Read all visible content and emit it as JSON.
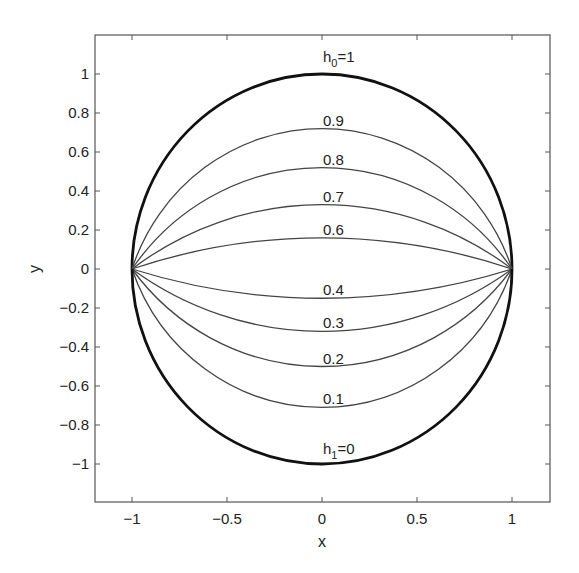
{
  "chart_data": {
    "type": "line",
    "title": "",
    "xlabel": "x",
    "ylabel": "y",
    "xlim": [
      -1.2,
      1.2
    ],
    "ylim": [
      -1.2,
      1.2
    ],
    "grid": false,
    "legend": "none (inline curve labels)",
    "xticks": [
      -1,
      -0.5,
      0,
      0.5,
      1
    ],
    "xtick_labels": [
      "−1",
      "−0.5",
      "0",
      "0.5",
      "1"
    ],
    "yticks": [
      -1,
      -0.8,
      -0.6,
      -0.4,
      -0.2,
      0,
      0.2,
      0.4,
      0.6,
      0.8,
      1
    ],
    "ytick_labels": [
      "−1",
      "−0.8",
      "−0.6",
      "−0.4",
      "−0.2",
      "0",
      "0.2",
      "0.4",
      "0.6",
      "0.8",
      "1"
    ],
    "series": [
      {
        "name": "h0=1",
        "label_main": "h",
        "label_sub": "0",
        "label_rest": "=1",
        "apex_y": 1.0,
        "bold": true
      },
      {
        "name": "0.9",
        "label_main": "0.9",
        "apex_y": 0.72,
        "bold": false
      },
      {
        "name": "0.8",
        "label_main": "0.8",
        "apex_y": 0.52,
        "bold": false
      },
      {
        "name": "0.7",
        "label_main": "0.7",
        "apex_y": 0.33,
        "bold": false
      },
      {
        "name": "0.6",
        "label_main": "0.6",
        "apex_y": 0.16,
        "bold": false
      },
      {
        "name": "0.4",
        "label_main": "0.4",
        "apex_y": -0.15,
        "bold": false
      },
      {
        "name": "0.3",
        "label_main": "0.3",
        "apex_y": -0.32,
        "bold": false
      },
      {
        "name": "0.2",
        "label_main": "0.2",
        "apex_y": -0.5,
        "bold": false
      },
      {
        "name": "0.1",
        "label_main": "0.1",
        "apex_y": -0.71,
        "bold": false
      },
      {
        "name": "h1=0",
        "label_main": "h",
        "label_sub": "1",
        "label_rest": "=0",
        "apex_y": -1.0,
        "bold": true
      }
    ],
    "common_points": [
      [
        -1,
        0
      ],
      [
        1,
        0
      ]
    ]
  }
}
